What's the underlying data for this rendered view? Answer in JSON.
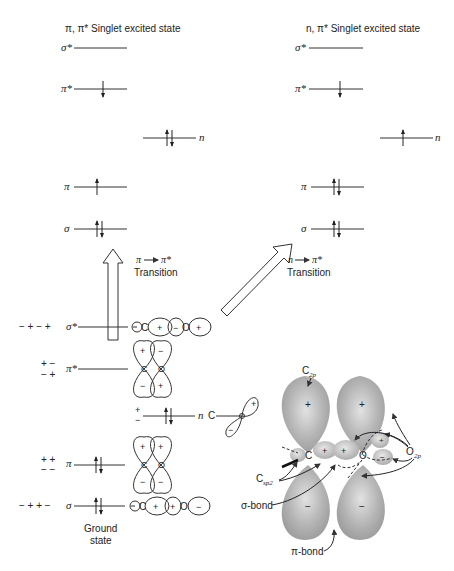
{
  "left_state": {
    "title": "π, π* Singlet excited state",
    "levels": [
      {
        "label": "σ*",
        "electrons": ""
      },
      {
        "label": "π*",
        "electrons": "↓"
      },
      {
        "label": "n",
        "electrons": "↑↓"
      },
      {
        "label": "π",
        "electrons": "↑"
      },
      {
        "label": "σ",
        "electrons": "↑↓"
      }
    ]
  },
  "right_state": {
    "title": "n, π* Singlet excited state",
    "levels": [
      {
        "label": "σ*",
        "electrons": ""
      },
      {
        "label": "π*",
        "electrons": "↓"
      },
      {
        "label": "n",
        "electrons": "↑"
      },
      {
        "label": "π",
        "electrons": "↑↓"
      },
      {
        "label": "σ",
        "electrons": "↑↓"
      }
    ]
  },
  "transitions": {
    "pi_pi_star": {
      "label_from": "π",
      "label_to": "π*",
      "word": "Transition"
    },
    "n_pi_star": {
      "label_from": "n",
      "label_to": "π*",
      "word": "Transition"
    }
  },
  "ground_state": {
    "label_line1": "Ground",
    "label_line2": "state",
    "levels": [
      {
        "label": "σ*",
        "signs": "− + − +",
        "electrons": ""
      },
      {
        "label": "π*",
        "signs_top": "+ −",
        "signs_bottom": "− +",
        "electrons": ""
      },
      {
        "label": "n",
        "signs_top": "+",
        "signs_bottom": "−",
        "electrons": "↑↓"
      },
      {
        "label": "π",
        "signs_top": "+ +",
        "signs_bottom": "− −",
        "electrons": "↑↓"
      },
      {
        "label": "σ",
        "signs": "− + + −",
        "electrons": "↑↓"
      }
    ],
    "orbital_atoms": {
      "carbon": "C",
      "oxygen": "O"
    }
  },
  "orbital_picture": {
    "labels": {
      "c2p": "C",
      "c2p_sub": "2p",
      "csp2": "C",
      "csp2_sub": "sp2",
      "o2p": "O",
      "o2p_sub": "2p",
      "sigma_bond": "σ-bond",
      "pi_bond": "π-bond",
      "carbon": "C",
      "oxygen": "O"
    },
    "signs": {
      "top": "+",
      "bottom": "−"
    }
  }
}
